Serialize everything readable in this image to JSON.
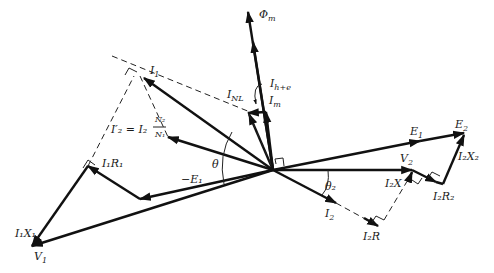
{
  "diagram": {
    "origin": [
      273,
      170
    ],
    "labels": {
      "phi_m": {
        "main": "Φ",
        "sub": "m"
      },
      "i_h_e": {
        "main": "I",
        "sub": "h+e"
      },
      "i_m": {
        "main": "I",
        "sub": "m"
      },
      "i_nl": {
        "main": "I",
        "sub": "NL"
      },
      "i_1": {
        "main": "I",
        "sub": "1"
      },
      "i2_prime": {
        "text": "I′₂ = I₂",
        "frac_num": "N₂",
        "frac_den": "N₁"
      },
      "i1r1": {
        "text": "I₁R₁"
      },
      "neg_e1": {
        "text": "−E₁"
      },
      "theta": {
        "text": "θ"
      },
      "i1x1": {
        "text": "I₁X₁"
      },
      "v_1": {
        "main": "V",
        "sub": "1"
      },
      "e_1": {
        "main": "E",
        "sub": "1"
      },
      "e_2": {
        "main": "E",
        "sub": "2"
      },
      "v_2": {
        "main": "V",
        "sub": "2"
      },
      "i2x2": {
        "text": "I₂X₂"
      },
      "i2r2": {
        "text": "I₂R₂"
      },
      "i2x": {
        "text": "I₂X"
      },
      "theta_2": {
        "text": "θ₂"
      },
      "i_2": {
        "main": "I",
        "sub": "2"
      },
      "i2r": {
        "text": "I₂R"
      }
    },
    "colors": {
      "stroke": "#111111",
      "background": "#ffffff"
    }
  }
}
